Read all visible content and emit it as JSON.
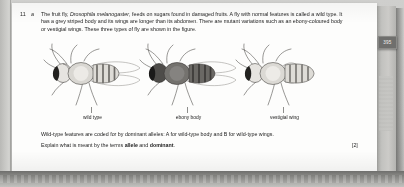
{
  "document": {
    "question_number": "11",
    "question_part": "a",
    "stem_line1": "The fruit fly, ",
    "species_italic": "Drosophila melanogaster",
    "stem_line1_cont": ", feeds on sugars found in damaged fruits. A fly with normal features",
    "stem_line2": "is called a wild type. It has a grey striped body and its wings are longer than its abdomen. There are mutant",
    "stem_line3": "variations such as an ebony-coloured body or vestigial wings. These three types of fly are shown in the figure.",
    "tail_line1": "Wild-type features are coded for by dominant alleles: A for wild-type body and B for wild-type wings.",
    "tail_line2_pre": "Explain what is meant by the terms ",
    "tail_line2_term1": "allele",
    "tail_line2_mid": " and ",
    "tail_line2_term2": "dominant",
    "tail_line2_post": ".",
    "marks": "[2]"
  },
  "figure": {
    "flies": [
      {
        "label": "wild type",
        "body_tone": "#e8e6e2",
        "thorax_tone": "#cfcdc8",
        "wing": "long"
      },
      {
        "label": "ebony body",
        "body_tone": "#6f6d69",
        "thorax_tone": "#565451",
        "wing": "long"
      },
      {
        "label": "vestigial wing",
        "body_tone": "#e6e4e0",
        "thorax_tone": "#cbc9c4",
        "wing": "short"
      }
    ]
  },
  "margin": {
    "page_number": "395"
  },
  "colors": {
    "page": "#fdfdfc",
    "gutter": "#c6c6c4",
    "ink": "#1b1b1b",
    "badge_bg": "#6f6f6d",
    "badge_text": "#f1f1ef"
  }
}
